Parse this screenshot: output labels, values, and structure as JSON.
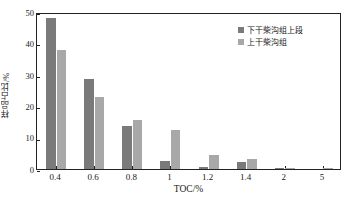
{
  "chart_data": {
    "type": "bar",
    "title": "",
    "subtitle": "",
    "xlabel": "TOC/%",
    "ylabel": "样品占比/%",
    "categories": [
      "0.4",
      "0.6",
      "0.8",
      "1",
      "1.2",
      "1.4",
      "2",
      "5"
    ],
    "series": [
      {
        "name": "下干柴沟组上段",
        "color": "#7a7a7a",
        "values": [
          48.0,
          28.7,
          13.7,
          2.6,
          0.5,
          2.3,
          0.3,
          0.0
        ]
      },
      {
        "name": "上干柴沟组",
        "color": "#a8a8a8",
        "values": [
          37.8,
          22.8,
          15.7,
          12.4,
          4.4,
          3.2,
          0.3,
          0.3
        ]
      }
    ],
    "ylim": [
      0,
      50
    ],
    "yticks": [
      0,
      10,
      20,
      30,
      40,
      50
    ],
    "ytick_labels": [
      "0",
      "10",
      "20",
      "30",
      "40",
      "50"
    ],
    "grid": false,
    "legend_position": "top-right",
    "axis_frame": "box",
    "axis_color": "#222222"
  },
  "legend": {
    "entries": [
      {
        "label": "下干柴沟组上段",
        "color": "#7a7a7a"
      },
      {
        "label": "上干柴沟组",
        "color": "#a8a8a8"
      }
    ]
  }
}
